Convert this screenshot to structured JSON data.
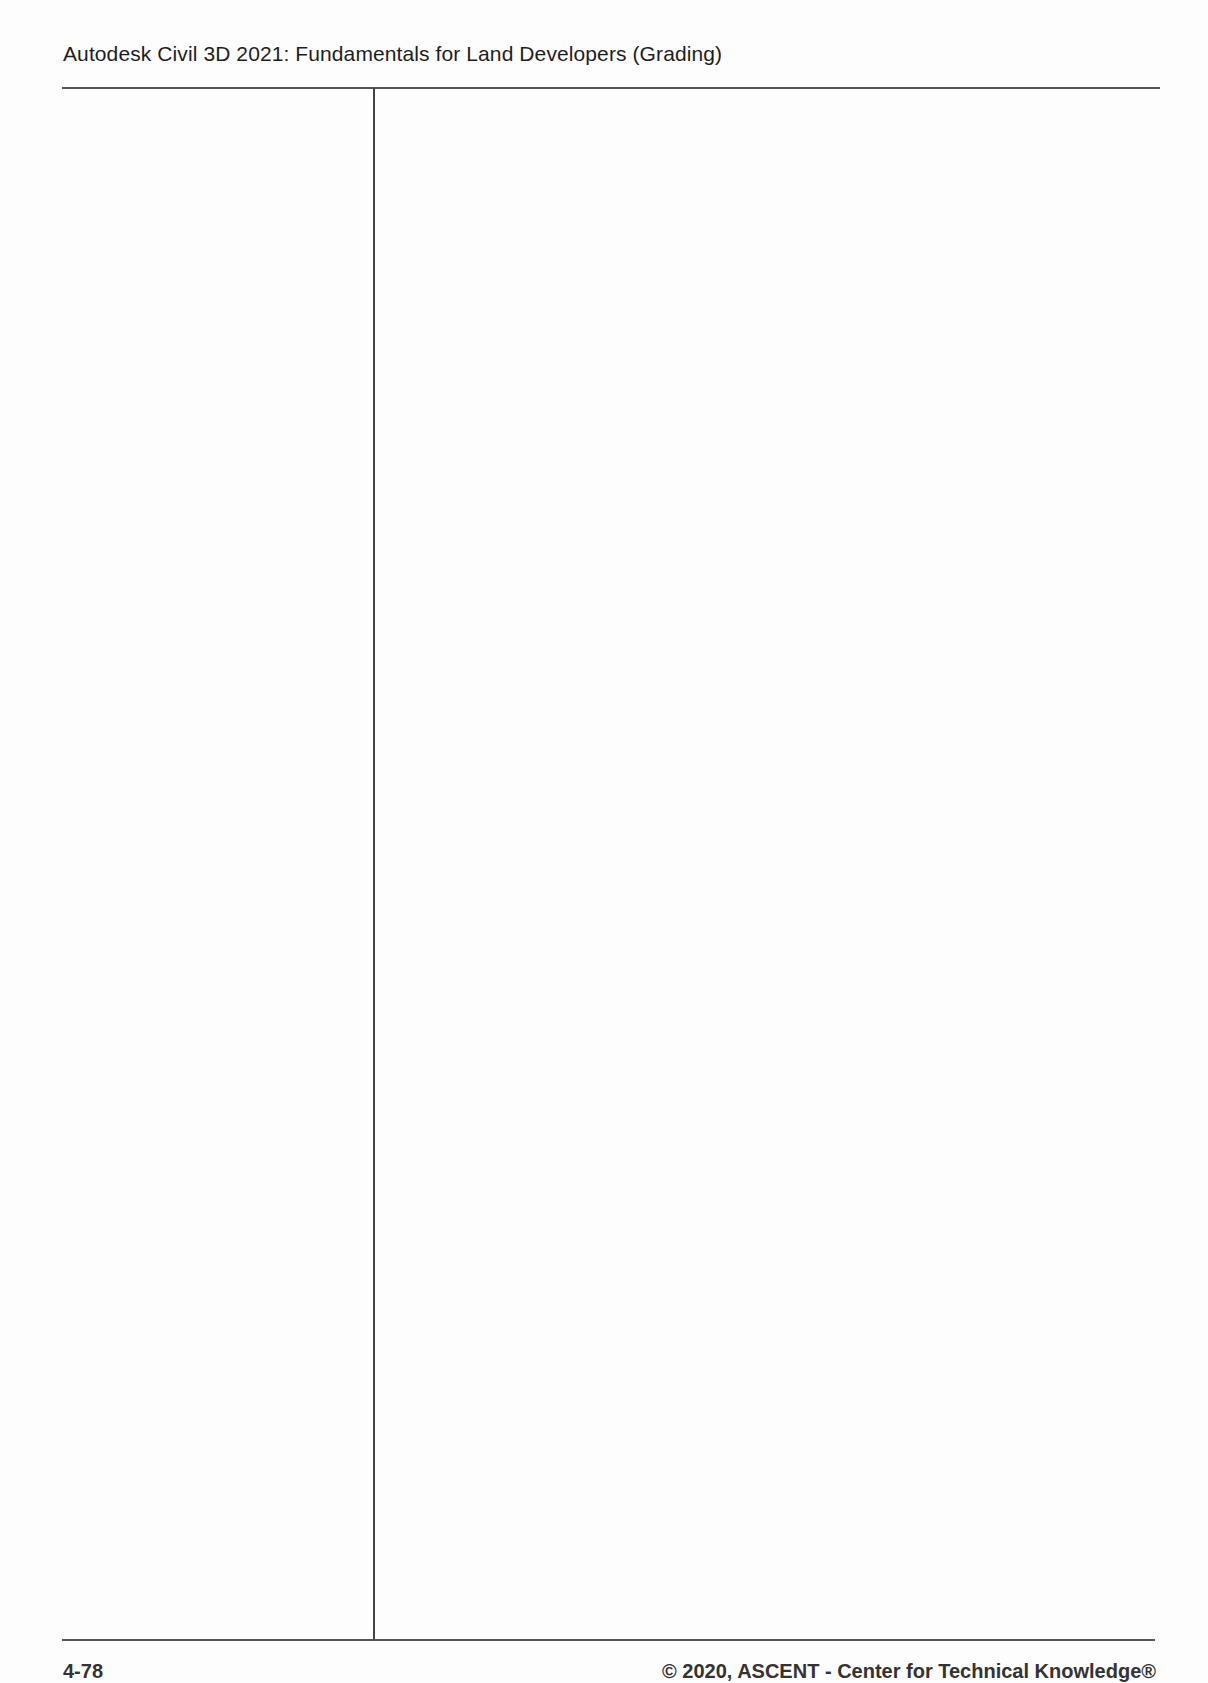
{
  "header": {
    "title": "Autodesk Civil 3D 2021: Fundamentals for Land Developers (Grading)"
  },
  "layout": {
    "columns": 2,
    "rule_color": "#555555"
  },
  "footer": {
    "page_number": "4-78",
    "copyright": "© 2020, ASCENT - Center for Technical Knowledge®"
  }
}
